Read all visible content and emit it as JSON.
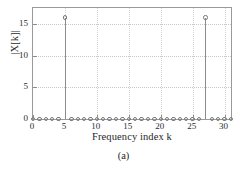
{
  "chart_data": {
    "type": "bar",
    "style": "stem",
    "title": "",
    "subtitle": "",
    "xlabel": "Frequency index k",
    "ylabel": "|X[k]|",
    "caption": "(a)",
    "grid": true,
    "legend": null,
    "xlim": [
      0,
      31
    ],
    "ylim": [
      0,
      17.5
    ],
    "xticks": [
      0,
      5,
      10,
      15,
      20,
      25,
      30
    ],
    "xticklabels": [
      "0",
      "5",
      "10",
      "15",
      "20",
      "25",
      "30"
    ],
    "yticks": [
      0,
      5,
      10,
      15
    ],
    "yticklabels": [
      "0",
      "5",
      "10",
      "15"
    ],
    "marker": "circle-open",
    "x": [
      0,
      1,
      2,
      3,
      4,
      5,
      6,
      7,
      8,
      9,
      10,
      11,
      12,
      13,
      14,
      15,
      16,
      17,
      18,
      19,
      20,
      21,
      22,
      23,
      24,
      25,
      26,
      27,
      28,
      29,
      30,
      31
    ],
    "values": [
      0,
      0,
      0,
      0,
      0,
      16,
      0,
      0,
      0,
      0,
      0,
      0,
      0,
      0,
      0,
      0,
      0,
      0,
      0,
      0,
      0,
      0,
      0,
      0,
      0,
      0,
      0,
      16,
      0,
      0,
      0,
      0
    ],
    "peaks": [
      {
        "k": 5,
        "value": 16
      },
      {
        "k": 27,
        "value": 16
      }
    ]
  },
  "figure": {
    "caption_label": "(a)"
  }
}
